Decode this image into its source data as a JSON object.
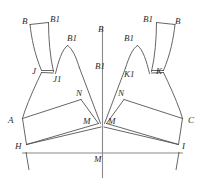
{
  "diagram": {
    "stroke_color": "#4a4a4a",
    "axis_color": "#8a8a8a",
    "background_color": "#ffffff",
    "label_color": "#2b2b2b",
    "width": 205,
    "height": 185
  },
  "labels": {
    "left_strap_outer_top": "B",
    "left_strap_inner_top": "B1",
    "left_cup_peak": "B1",
    "left_notch_outer": "J",
    "left_notch_inner": "J1",
    "left_band_top": "N",
    "left_band_center": "M",
    "left_side_point": "A",
    "left_hem_point": "H",
    "center_axis_top": "B",
    "center_axis_mid": "B1",
    "center_hem": "M",
    "right_strap_outer_top": "B",
    "right_strap_inner_top": "B1",
    "right_cup_peak": "B1",
    "right_notch_inner": "K1",
    "right_notch_outer": "K",
    "right_band_top": "N",
    "right_band_center": "M",
    "right_side_point": "C",
    "right_hem_point": "I"
  },
  "label_positions": {
    "left_strap_outer_top": {
      "x": 22,
      "y": 21
    },
    "left_strap_inner_top": {
      "x": 50,
      "y": 20
    },
    "left_cup_peak": {
      "x": 68,
      "y": 39
    },
    "left_notch_outer": {
      "x": 33,
      "y": 72
    },
    "left_notch_inner": {
      "x": 54,
      "y": 80
    },
    "left_band_top": {
      "x": 77,
      "y": 93
    },
    "left_band_center": {
      "x": 84,
      "y": 121
    },
    "left_side_point": {
      "x": 10,
      "y": 120
    },
    "left_hem_point": {
      "x": 17,
      "y": 147
    },
    "center_axis_top": {
      "x": 99,
      "y": 30
    },
    "center_axis_mid": {
      "x": 97,
      "y": 67
    },
    "center_hem": {
      "x": 95,
      "y": 157
    },
    "right_strap_outer_top": {
      "x": 174,
      "y": 21
    },
    "right_strap_inner_top": {
      "x": 144,
      "y": 20
    },
    "right_cup_peak": {
      "x": 126,
      "y": 39
    },
    "right_notch_inner": {
      "x": 125,
      "y": 72
    },
    "right_notch_outer": {
      "x": 155,
      "y": 70
    },
    "right_band_top": {
      "x": 119,
      "y": 93
    },
    "right_band_center": {
      "x": 110,
      "y": 121
    },
    "right_side_point": {
      "x": 186,
      "y": 120
    },
    "right_hem_point": {
      "x": 179,
      "y": 147
    }
  },
  "geometry": {
    "center_axis": {
      "x": 102.5,
      "y_top": 26,
      "y_bottom": 178
    },
    "hem_line": {
      "x_left": 22,
      "x_right": 183,
      "y": 153
    },
    "left_piece": {
      "strap_outer": "M30,24 L31.5,27 C33,40 37,55 45,70",
      "strap_inner": "M48.5,23 C49,40 52,57 55.5,71",
      "strap_top": "M30,24 L48.5,23",
      "cup_curve": "M58,72 C60,60 63,50 69,46 C73,47 76,55 79,66",
      "notch_tick": "M38,73 L55,74",
      "outer_body": "M38,73 C32,85 26,100 22,115 L22,118",
      "side_to_hem": "M22,118 L26,144",
      "band_top_edge": "M22,118 L80,99",
      "band_bottom_edge": "M26,144 L97,124",
      "band_right_edge": "M80,99 L97,124",
      "upper_panel_edge": "M79,66 L97,124",
      "hem_connect": "M26,144 L97,124"
    },
    "right_piece": {
      "mirror_of": "left_piece",
      "mirror_axis_x": 102.5
    },
    "hem_ticks": [
      {
        "x": 26,
        "y_top": 153,
        "y_bottom": 168
      },
      {
        "x": 179,
        "y_top": 153,
        "y_bottom": 168
      }
    ]
  }
}
